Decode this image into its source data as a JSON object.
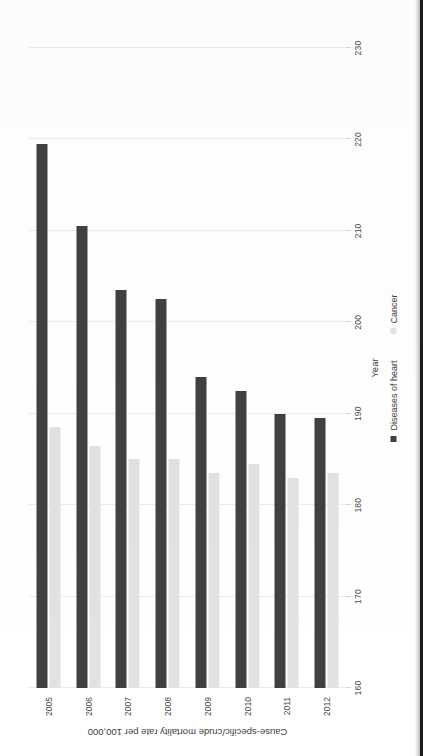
{
  "chart_data": {
    "type": "bar",
    "orientation": "horizontal",
    "title": "",
    "xlabel": "Year",
    "ylabel": "Cause-specific/crude mortality rate per 100,000",
    "categories": [
      "2005",
      "2006",
      "2007",
      "2008",
      "2009",
      "2010",
      "2011",
      "2012"
    ],
    "series": [
      {
        "name": "Diseases of heart",
        "color": "#404040",
        "values": [
          219.5,
          210.5,
          203.5,
          202.5,
          194.0,
          192.5,
          190.0,
          189.5
        ]
      },
      {
        "name": "Cancer",
        "color": "#e2e2e2",
        "values": [
          188.5,
          186.5,
          185.0,
          185.0,
          183.5,
          184.5,
          183.0,
          183.5
        ]
      }
    ],
    "ylim": [
      160,
      230
    ],
    "value_ticks": [
      "230",
      "220",
      "210",
      "200",
      "190",
      "180",
      "170",
      "160"
    ],
    "value_tick_values": [
      230,
      220,
      210,
      200,
      190,
      180,
      170,
      160
    ],
    "grid": true,
    "grid_axis": "value",
    "legend_position": "bottom",
    "axis_baseline_value": 160
  },
  "axes": {
    "value_axis_title": "Cause-specific/crude mortality rate per 100,000",
    "category_axis_title": "Year"
  },
  "legend": {
    "items": [
      {
        "label": "Diseases of heart",
        "color": "#404040"
      },
      {
        "label": "Cancer",
        "color": "#e2e2e2"
      }
    ]
  },
  "page": {
    "background": "#ffffff",
    "binding_edge_color": "#1c1c1c"
  }
}
